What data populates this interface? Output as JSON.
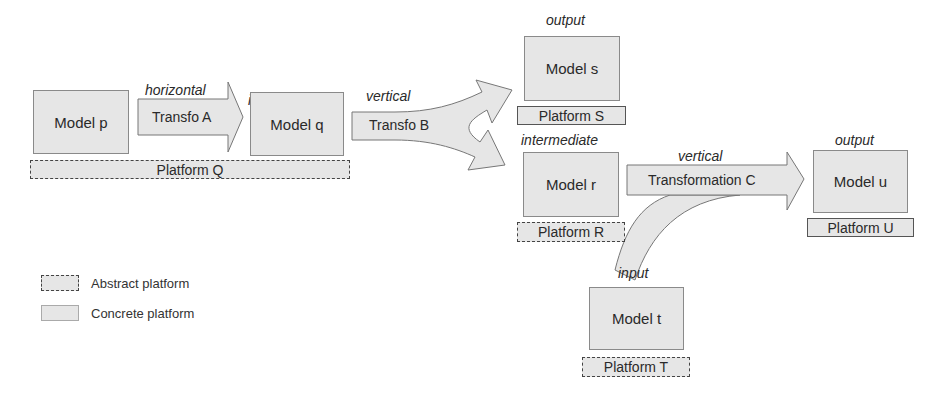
{
  "diagram": {
    "models": {
      "p": {
        "role": "input",
        "label": "Model p"
      },
      "q": {
        "role": "intermediate",
        "label": "Model q"
      },
      "s": {
        "role": "output",
        "label": "Model s"
      },
      "r": {
        "role": "intermediate",
        "label": "Model r"
      },
      "u": {
        "role": "output",
        "label": "Model u"
      },
      "t": {
        "role": "input",
        "label": "Model t"
      }
    },
    "platforms": {
      "Q": {
        "label": "Platform Q",
        "kind": "abstract"
      },
      "S": {
        "label": "Platform S",
        "kind": "concrete"
      },
      "R": {
        "label": "Platform R",
        "kind": "abstract"
      },
      "U": {
        "label": "Platform U",
        "kind": "concrete"
      },
      "T": {
        "label": "Platform T",
        "kind": "abstract"
      }
    },
    "transformations": {
      "A": {
        "direction": "horizontal",
        "label": "Transfo A"
      },
      "B": {
        "direction": "vertical",
        "label": "Transfo B"
      },
      "C": {
        "direction": "vertical",
        "label": "Transformation C"
      }
    },
    "legend": {
      "abstract": "Abstract platform",
      "concrete": "Concrete platform"
    },
    "colors": {
      "fill": "#e6e6e6",
      "border": "#8a8a8a"
    }
  }
}
